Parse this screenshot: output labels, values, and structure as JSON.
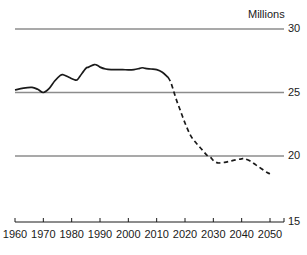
{
  "chart_data": {
    "type": "line",
    "title": "",
    "subtitle": "",
    "xlabel": "",
    "ylabel": "Millions",
    "unit_note": "Millions",
    "xlim": [
      1960,
      2050
    ],
    "ylim": [
      15,
      30
    ],
    "xticks": [
      1960,
      1970,
      1980,
      1990,
      2000,
      2010,
      2020,
      2030,
      2040,
      2050
    ],
    "xtick_labels": [
      "1960",
      "1970",
      "1980",
      "1990",
      "2000",
      "2010",
      "2020",
      "2030",
      "2040",
      "2050"
    ],
    "yticks": [
      15,
      20,
      25,
      30
    ],
    "ytick_labels": [
      "15",
      "20",
      "25",
      "30"
    ],
    "gridlines": [
      20,
      25,
      30
    ],
    "grid": true,
    "legend_position": "none",
    "line_color": "#1a1a1a",
    "grid_color": "#8c8c8c",
    "axis_color": "#1a1a1a",
    "series": [
      {
        "name": "historical",
        "style": "solid",
        "x": [
          1960,
          1963,
          1966,
          1968,
          1970,
          1972,
          1974,
          1976,
          1977,
          1979,
          1981,
          1982,
          1983,
          1985,
          1986,
          1988,
          1989,
          1990,
          1992,
          1994,
          1996,
          1998,
          2000,
          2002,
          2004,
          2005,
          2006,
          2008,
          2010,
          2012,
          2014
        ],
        "y": [
          25.2,
          25.35,
          25.4,
          25.25,
          25.0,
          25.3,
          25.9,
          26.35,
          26.4,
          26.2,
          26.0,
          26.0,
          26.3,
          26.9,
          27.0,
          27.2,
          27.15,
          27.0,
          26.85,
          26.8,
          26.8,
          26.8,
          26.78,
          26.8,
          26.9,
          26.95,
          26.9,
          26.85,
          26.8,
          26.6,
          26.2
        ]
      },
      {
        "name": "projection",
        "style": "dashed",
        "x": [
          2014,
          2015,
          2016,
          2017,
          2018,
          2020,
          2022,
          2024,
          2026,
          2028,
          2029,
          2030,
          2031,
          2032,
          2034,
          2036,
          2038,
          2040,
          2041,
          2043,
          2045,
          2047,
          2049,
          2050
        ],
        "y": [
          26.2,
          25.8,
          25.1,
          24.4,
          23.8,
          22.6,
          21.6,
          21.0,
          20.5,
          20.0,
          19.9,
          19.65,
          19.5,
          19.45,
          19.5,
          19.6,
          19.7,
          19.78,
          19.78,
          19.6,
          19.3,
          19.0,
          18.7,
          18.6
        ]
      }
    ]
  }
}
